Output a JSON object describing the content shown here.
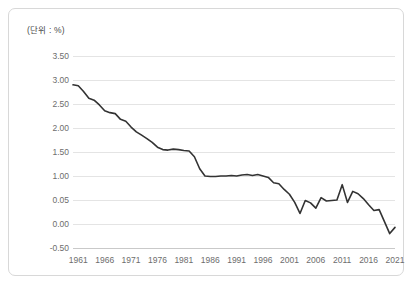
{
  "unit_label": "(단위 : %)",
  "colors": {
    "line": "#333333",
    "grid": "#e4e4e4",
    "axis": "#c9c9c9",
    "tick_text": "#6d6d6d",
    "card_border": "#d8d8d8",
    "background": "#ffffff"
  },
  "chart_data": {
    "type": "line",
    "title": "",
    "subtitle": "",
    "xlabel": "",
    "ylabel": "(단위 : %)",
    "grid": true,
    "legend": "none",
    "xlim": [
      1960,
      2021
    ],
    "ylim": [
      -0.5,
      3.5
    ],
    "ytick_labels": [
      "3.50",
      "3.00",
      "2.50",
      "2.00",
      "1.50",
      "1.00",
      "0.05",
      "0.00",
      "-0.50"
    ],
    "ytick_values": [
      3.5,
      3.0,
      2.5,
      2.0,
      1.5,
      1.0,
      0.5,
      0.0,
      -0.5
    ],
    "xtick_labels": [
      "1961",
      "1966",
      "1971",
      "1976",
      "1981",
      "1986",
      "1991",
      "1996",
      "2001",
      "2006",
      "2011",
      "2016",
      "2021"
    ],
    "xtick_values": [
      1961,
      1966,
      1971,
      1976,
      1981,
      1986,
      1991,
      1996,
      2001,
      2006,
      2011,
      2016,
      2021
    ],
    "series": [
      {
        "name": "인구증가율",
        "x": [
          1960,
          1961,
          1962,
          1963,
          1964,
          1965,
          1966,
          1967,
          1968,
          1969,
          1970,
          1971,
          1972,
          1973,
          1974,
          1975,
          1976,
          1977,
          1978,
          1979,
          1980,
          1981,
          1982,
          1983,
          1984,
          1985,
          1986,
          1987,
          1988,
          1989,
          1990,
          1991,
          1992,
          1993,
          1994,
          1995,
          1996,
          1997,
          1998,
          1999,
          2000,
          2001,
          2002,
          2003,
          2004,
          2005,
          2006,
          2007,
          2008,
          2009,
          2010,
          2011,
          2012,
          2013,
          2014,
          2015,
          2016,
          2017,
          2018,
          2019,
          2020,
          2021
        ],
        "values": [
          2.9,
          2.88,
          2.76,
          2.62,
          2.58,
          2.48,
          2.36,
          2.32,
          2.3,
          2.18,
          2.14,
          2.02,
          1.92,
          1.85,
          1.78,
          1.7,
          1.6,
          1.55,
          1.54,
          1.56,
          1.55,
          1.53,
          1.52,
          1.4,
          1.15,
          1.0,
          0.99,
          0.99,
          1.0,
          1.0,
          1.01,
          1.0,
          1.02,
          1.03,
          1.01,
          1.03,
          1.0,
          0.97,
          0.86,
          0.84,
          0.72,
          0.62,
          0.45,
          0.22,
          0.49,
          0.44,
          0.33,
          0.55,
          0.48,
          0.49,
          0.5,
          0.82,
          0.45,
          0.68,
          0.63,
          0.53,
          0.4,
          0.28,
          0.3,
          0.05,
          -0.2,
          -0.07
        ]
      }
    ]
  }
}
